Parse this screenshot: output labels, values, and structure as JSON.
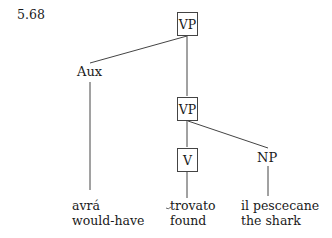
{
  "example_number": "5.68",
  "tree": {
    "root": {
      "label": "VP",
      "boxed": true
    },
    "aux": {
      "label": "Aux",
      "boxed": false,
      "leaf": {
        "word": "avrá",
        "gloss": "would-have"
      }
    },
    "vp2": {
      "label": "VP",
      "boxed": true
    },
    "v": {
      "label": "V",
      "boxed": true,
      "leaf": {
        "word": "trovato",
        "gloss": "found"
      }
    },
    "np": {
      "label": "NP",
      "boxed": false,
      "leaf": {
        "word": "il pescecane",
        "gloss": "the shark"
      }
    }
  },
  "edges": [
    {
      "from": "VP",
      "to": "Aux"
    },
    {
      "from": "VP",
      "to": "VP"
    },
    {
      "from": "Aux",
      "to": "avrá"
    },
    {
      "from": "VP",
      "to": "V"
    },
    {
      "from": "VP",
      "to": "NP"
    },
    {
      "from": "V",
      "to": "trovato"
    },
    {
      "from": "NP",
      "to": "il pescecane"
    }
  ]
}
